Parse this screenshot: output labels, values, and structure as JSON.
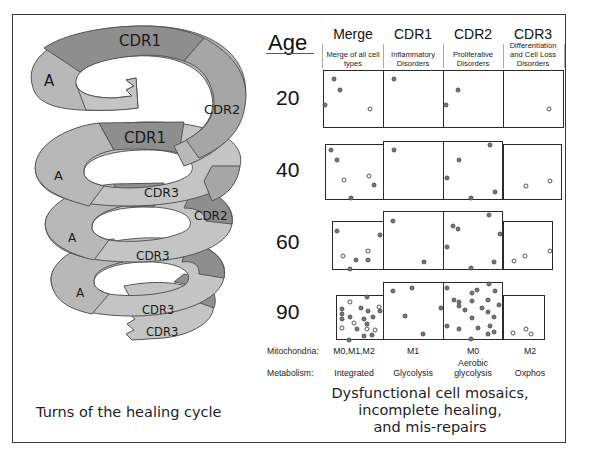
{
  "spiral": {
    "caption": "Turns of the healing cycle",
    "segment_labels": {
      "turn1": [
        "A",
        "CDR1",
        "CDR2"
      ],
      "turn2": [
        "A",
        "CDR1",
        "CDR3",
        "CDR2"
      ],
      "turn3": [
        "A",
        "CDR3"
      ],
      "turn4": [
        "A",
        "CDR3"
      ],
      "tail": [
        "CDR3"
      ]
    },
    "colors": {
      "A": "#b8b8b8",
      "CDR1": "#8e8e8e",
      "CDR2": "#a6a6a6",
      "CDR3": "#c4c4c4",
      "outline": "#555555"
    }
  },
  "table": {
    "age_title": "Age",
    "columns": [
      {
        "title": "Merge",
        "subtitle": "Merge of all cell types"
      },
      {
        "title": "CDR1",
        "subtitle": "Inflammatory Disorders"
      },
      {
        "title": "CDR2",
        "subtitle": "Proliferative Disorders"
      },
      {
        "title": "CDR3",
        "subtitle": "Differentiation and Cell Loss Disorders"
      }
    ],
    "ages": [
      "20",
      "40",
      "60",
      "90"
    ],
    "mitochondria": {
      "label": "Mitochondria:",
      "values": [
        "M0,M1,M2",
        "M1",
        "M0",
        "M2"
      ]
    },
    "metabolism": {
      "label": "Metabolism:",
      "values": [
        "Integrated",
        "Glycolysis",
        "Aerobic glycolysis",
        "Oxphos"
      ]
    }
  },
  "summary": {
    "line1": "Dysfunctional cell mosaics,",
    "line2": "incomplete healing,",
    "line3": "and mis-repairs"
  }
}
